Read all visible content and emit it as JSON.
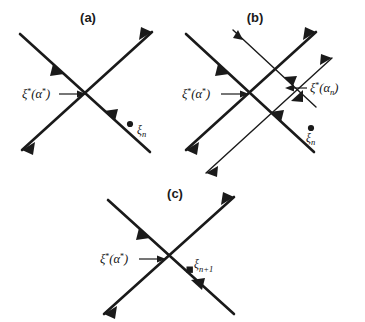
{
  "figure": {
    "background_color": "#ffffff",
    "stroke_color": "#1a1a1a",
    "type": "phase-portrait-diagram",
    "panel_count": 3
  },
  "panels": [
    {
      "id": "a",
      "title": "(a)",
      "title_pos": {
        "x": 88,
        "y": 22
      },
      "description": "Single saddle crossing with fixed point and iterate xi_n off the manifolds",
      "labels": [
        {
          "name": "fixed-point-label",
          "base": "ξ",
          "sup": "*",
          "open": "(",
          "arg": "α",
          "arg_sup": "*",
          "close": ")",
          "x": 22,
          "y": 98,
          "arrow": {
            "x1": 59,
            "y1": 94,
            "x2": 84,
            "y2": 94
          }
        },
        {
          "name": "iterate-label",
          "base": "ξ",
          "sub": "n",
          "x": 138,
          "y": 134
        }
      ],
      "dots": [
        {
          "name": "iterate-point",
          "cx": 130,
          "cy": 124,
          "r": 3.1
        }
      ],
      "lines": [
        {
          "name": "stable-manifold",
          "x1": 20,
          "y1": 34,
          "x2": 150,
          "y2": 152,
          "width": 2.6,
          "arrows": [
            "mid-forward",
            "end-none"
          ]
        },
        {
          "name": "unstable-manifold",
          "x1": 22,
          "y1": 150,
          "x2": 152,
          "y2": 32,
          "width": 2.6,
          "arrows": [
            "start-out",
            "end-out"
          ]
        }
      ]
    },
    {
      "id": "b",
      "title": "(b)",
      "title_pos": {
        "x": 255,
        "y": 22
      },
      "description": "Two saddle crossings: true fixed point xi*(alpha*) and approximate xi*(alpha_n)",
      "labels": [
        {
          "name": "fixed-point-label",
          "base": "ξ",
          "sup": "*",
          "open": "(",
          "arg": "α",
          "arg_sup": "*",
          "close": ")",
          "x": 182,
          "y": 98,
          "arrow": {
            "x1": 232,
            "y1": 94,
            "x2": 252,
            "y2": 94
          }
        },
        {
          "name": "approx-fixed-point-label",
          "base": "ξ",
          "sup": "*",
          "open": "(",
          "arg": "α",
          "arg_sub": "n",
          "close": ")",
          "x": 310,
          "y": 92,
          "arrow": {
            "x1": 307,
            "y1": 88,
            "x2": 288,
            "y2": 88
          }
        },
        {
          "name": "iterate-label",
          "base": "ξ",
          "sub": "n",
          "x": 315,
          "y": 141
        }
      ],
      "dots": [
        {
          "name": "iterate-point",
          "cx": 311,
          "cy": 128,
          "r": 3.1
        }
      ],
      "lines": [
        {
          "name": "stable-manifold-true",
          "x1": 186,
          "y1": 34,
          "x2": 312,
          "y2": 150,
          "width": 2.6,
          "arrows": [
            "mid-forward"
          ]
        },
        {
          "name": "unstable-manifold-true",
          "x1": 186,
          "y1": 148,
          "x2": 316,
          "y2": 32,
          "width": 2.6,
          "arrows": [
            "start-out",
            "end-out"
          ]
        },
        {
          "name": "stable-manifold-approx",
          "x1": 232,
          "y1": 30,
          "x2": 308,
          "y2": 100,
          "width": 1.4,
          "arrows": [
            "mid-forward"
          ]
        },
        {
          "name": "unstable-manifold-approx",
          "x1": 206,
          "y1": 172,
          "x2": 330,
          "y2": 60,
          "width": 1.4,
          "arrows": [
            "start-out",
            "end-out"
          ]
        }
      ]
    },
    {
      "id": "c",
      "title": "(c)",
      "title_pos": {
        "x": 175,
        "y": 198
      },
      "description": "Converged state: iterate xi_{n+1} lies on the stable manifold of xi*(alpha*)",
      "labels": [
        {
          "name": "fixed-point-label",
          "base": "ξ",
          "sup": "*",
          "open": "(",
          "arg": "α",
          "arg_sup": "*",
          "close": ")",
          "x": 100,
          "y": 263,
          "arrow": {
            "x1": 145,
            "y1": 259,
            "x2": 168,
            "y2": 259
          }
        },
        {
          "name": "next-iterate-label",
          "base": "ξ",
          "sub": "n+1",
          "x": 196,
          "y": 268
        }
      ],
      "dots": [
        {
          "name": "next-iterate-point",
          "cx": 190,
          "cy": 270,
          "r": 3.1
        }
      ],
      "lines": [
        {
          "name": "stable-manifold",
          "x1": 108,
          "y1": 200,
          "x2": 232,
          "y2": 312,
          "width": 2.6,
          "arrows": [
            "mid-forward",
            "mid2-forward"
          ]
        },
        {
          "name": "unstable-manifold",
          "x1": 104,
          "y1": 312,
          "x2": 232,
          "y2": 198,
          "width": 2.6,
          "arrows": [
            "start-out",
            "end-out"
          ]
        }
      ]
    }
  ]
}
